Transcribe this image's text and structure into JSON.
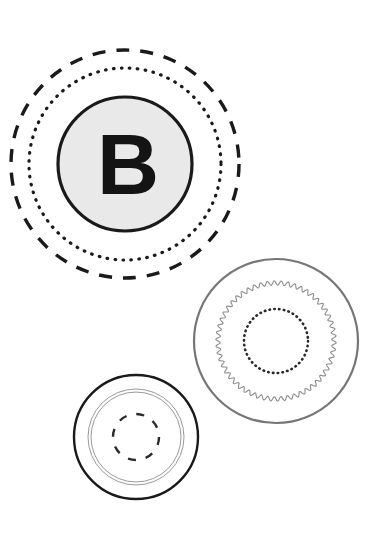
{
  "canvas": {
    "width": 390,
    "height": 544,
    "background_color": "#ffffff"
  },
  "figure": {
    "title": "",
    "label_letter": "B"
  },
  "palette": {
    "background": "#ffffff",
    "stroke_dark": "#1a1a1a",
    "stroke_mid": "#6e6e6e",
    "stroke_light": "#9a9a9a",
    "fill_gray": "#e9e9e9",
    "letter_color": "#141414"
  },
  "shapes": [
    {
      "name": "stamp-b",
      "center_x": 125,
      "center_y": 164,
      "rings": [
        {
          "name": "outer-dashed-ring",
          "radius": 114,
          "style": "dashed",
          "stroke_color": "#1a1a1a",
          "stroke_width": 3.4,
          "dash": "13 11"
        },
        {
          "name": "dotted-ring",
          "radius": 96,
          "style": "dotted",
          "stroke_color": "#1a1a1a",
          "stroke_width": 3.2,
          "dash": "0.6 7.4"
        },
        {
          "name": "solid-filled-disc",
          "radius": 67,
          "style": "solid",
          "stroke_color": "#1a1a1a",
          "stroke_width": 3.2,
          "fill": "#e9e9e9"
        }
      ],
      "letter": "B"
    },
    {
      "name": "stamp-scalloped",
      "center_x": 276,
      "center_y": 341,
      "rings": [
        {
          "name": "outer-solid-ring",
          "radius": 82,
          "style": "solid",
          "stroke_color": "#767676",
          "stroke_width": 2.2
        },
        {
          "name": "scalloped-wavy-ring",
          "radius": 58,
          "style": "wavy",
          "stroke_color": "#8d8d8d",
          "stroke_width": 1.1,
          "wave_count": 54,
          "wave_amplitude": 2.2
        },
        {
          "name": "inner-dotted-ring",
          "radius": 32,
          "style": "dotted",
          "stroke_color": "#2a2a2a",
          "stroke_width": 2.6,
          "dash": "0.5 4.3"
        }
      ],
      "letter": ""
    },
    {
      "name": "stamp-plain",
      "center_x": 136,
      "center_y": 437,
      "rings": [
        {
          "name": "outer-solid-ring",
          "radius": 62,
          "style": "solid",
          "stroke_color": "#1a1a1a",
          "stroke_width": 2.4
        },
        {
          "name": "thin-ring-outer",
          "radius": 48,
          "style": "solid",
          "stroke_color": "#9a9a9a",
          "stroke_width": 1.0
        },
        {
          "name": "thin-ring-inner",
          "radius": 45,
          "style": "solid",
          "stroke_color": "#9a9a9a",
          "stroke_width": 1.0
        },
        {
          "name": "inner-dashed-ring",
          "radius": 23,
          "style": "dashed",
          "stroke_color": "#2a2a2a",
          "stroke_width": 2.4,
          "dash": "8 10"
        }
      ],
      "letter": ""
    }
  ]
}
